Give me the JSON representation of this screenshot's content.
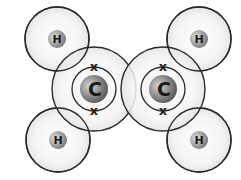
{
  "diagram": {
    "colors": {
      "shell_stroke": "#2a2a2a",
      "shell_fill": "#f2f2f2",
      "nucleus_carbon": "#8c8c8c",
      "nucleus_hydrogen": "#9a9a9a",
      "label": "#1a1a1a"
    },
    "atoms": [
      {
        "id": "h-top-left",
        "symbol": "H",
        "cx": 57,
        "cy": 39
      },
      {
        "id": "h-top-right",
        "symbol": "H",
        "cx": 199,
        "cy": 39
      },
      {
        "id": "h-bottom-left",
        "symbol": "H",
        "cx": 58,
        "cy": 140
      },
      {
        "id": "h-bottom-right",
        "symbol": "H",
        "cx": 199,
        "cy": 140
      },
      {
        "id": "c-left",
        "symbol": "C",
        "cx": 94,
        "cy": 89
      },
      {
        "id": "c-right",
        "symbol": "C",
        "cx": 163,
        "cy": 89
      }
    ],
    "electron_marker": "x",
    "labels": {
      "h1": "H",
      "h2": "H",
      "h3": "H",
      "h4": "H",
      "c1": "C",
      "c2": "C",
      "x": "x"
    }
  }
}
